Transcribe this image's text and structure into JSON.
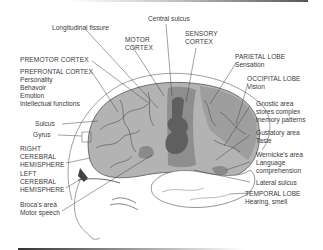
{
  "diagram": {
    "type": "labeled anatomical illustration",
    "colors": {
      "brain_base": "#b3b3b3",
      "motor_sensory_strip": "#8e8e8e",
      "central_dark_area": "#5f5f5f",
      "temporal_lobe": "#ffffff",
      "outline": "#555555",
      "text": "#3a3a3a"
    },
    "labels": {
      "central_sulcus": "Central sulcus",
      "longitudinal_fissure": "Longitudinal fissure",
      "motor_cortex": [
        "MOTOR",
        "CORTEX"
      ],
      "sensory_cortex": [
        "SENSORY",
        "CORTEX"
      ],
      "premotor_cortex": "PREMOTOR CORTEX",
      "prefrontal_cortex": {
        "title": "PREFRONTAL CORTEX",
        "functions": [
          "Personality",
          "Behavoir",
          "Emotion",
          "Intellectual functions"
        ]
      },
      "parietal_lobe": {
        "title": "PARIETAL LOBE",
        "function": "Sensation"
      },
      "occipital_lobe": {
        "title": "OCCIPITAL LOBE",
        "function": "Vision"
      },
      "gnostic_area": [
        "Gnostic area",
        "stores complex",
        "memory patterns"
      ],
      "gustatory_area": [
        "Gustatory area",
        "Taste"
      ],
      "wernickes_area": [
        "Wernicke's area",
        "Language",
        "comprehension"
      ],
      "lateral_sulcus": "Lateral sulcus",
      "temporal_lobe": {
        "title": "TEMPORAL LOBE",
        "function": "Hearing, smell"
      },
      "sulcus": "Sulcus",
      "gyrus": "Gyrus",
      "right_hemisphere": [
        "RIGHT",
        "CEREBRAL",
        "HEMISPHERE"
      ],
      "left_hemisphere": [
        "LEFT",
        "CEREBRAL",
        "HEMISPHERE"
      ],
      "brocas_area": [
        "Broca's area",
        "Motor speech"
      ]
    }
  }
}
